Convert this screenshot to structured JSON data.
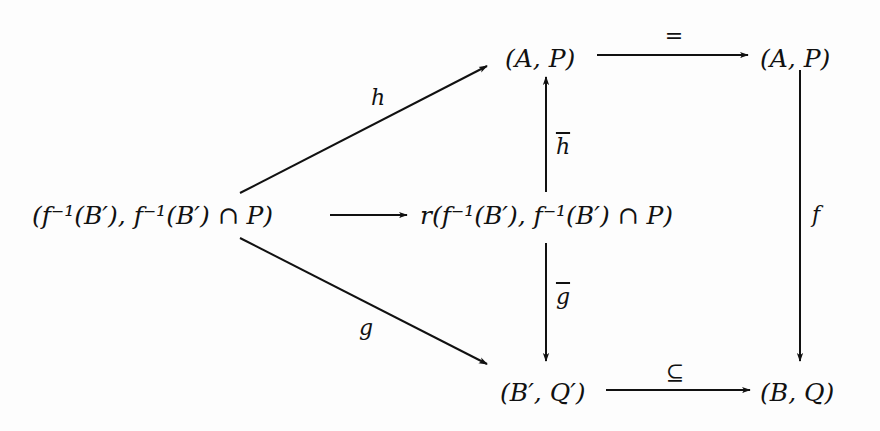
{
  "diagram": {
    "type": "commutative-diagram",
    "nodes": {
      "preimage_pair": "(f⁻¹(B′), f⁻¹(B′) ∩ P)",
      "r_preimage_pair": "r(f⁻¹(B′), f⁻¹(B′) ∩ P)",
      "ap_left": "(A, P)",
      "ap_right": "(A, P)",
      "bq_prime": "(B′, Q′)",
      "bq": "(B, Q)"
    },
    "arrows": {
      "h": {
        "label": "h",
        "from": "preimage_pair",
        "to": "ap_left"
      },
      "g": {
        "label": "g",
        "from": "preimage_pair",
        "to": "bq_prime"
      },
      "r": {
        "label": "",
        "from": "preimage_pair",
        "to": "r_preimage_pair"
      },
      "h_bar": {
        "label": "h",
        "from": "r_preimage_pair",
        "to": "ap_left",
        "overline": true
      },
      "g_bar": {
        "label": "g",
        "from": "r_preimage_pair",
        "to": "bq_prime",
        "overline": true
      },
      "equals": {
        "label": "=",
        "from": "ap_left",
        "to": "ap_right"
      },
      "f": {
        "label": "f",
        "from": "ap_right",
        "to": "bq"
      },
      "subset": {
        "label": "⊆",
        "from": "bq_prime",
        "to": "bq"
      }
    },
    "colors": {
      "ink": "#111111",
      "background": "#fdfdfd"
    }
  }
}
